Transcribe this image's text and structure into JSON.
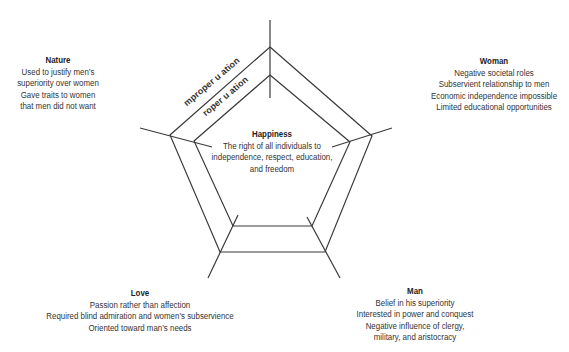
{
  "diagram": {
    "type": "pentagon-concept-map",
    "center": {
      "title": "Happiness",
      "lines": [
        "The right of all individuals to",
        "independence, respect, education,",
        "and freedom"
      ]
    },
    "edge_labels": {
      "outer": "mproper u ation",
      "inner": "roper u ation"
    },
    "nodes": {
      "nature": {
        "title": "Nature",
        "lines": [
          "Used to justify men’s",
          "superiority over women",
          "Gave traits to women",
          "that men did not want"
        ]
      },
      "woman": {
        "title": "Woman",
        "lines": [
          "Negative societal roles",
          "Subservient relationship to men",
          "Economic independence impossible",
          "Limited educational opportunities"
        ]
      },
      "love": {
        "title": "Love",
        "lines": [
          "Passion rather than affection",
          "Required blind admiration and women’s subservience",
          "Oriented toward man’s needs"
        ]
      },
      "man": {
        "title": "Man",
        "lines": [
          "Belief in his superiority",
          "Interested in power and conquest",
          "Negative influence of clergy,",
          "military, and aristocracy"
        ]
      }
    },
    "colors": {
      "line": "#3a3a3a",
      "text": "#333333",
      "background": "#ffffff"
    }
  }
}
